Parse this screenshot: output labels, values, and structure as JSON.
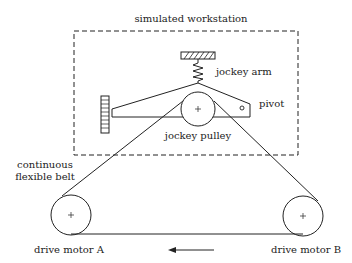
{
  "diagram": {
    "title": "simulated workstation",
    "labels": {
      "jockey_arm": "jockey arm",
      "pivot": "pivot",
      "jockey_pulley": "jockey pulley",
      "belt_line1": "continuous",
      "belt_line2": "flexible belt",
      "motor_a": "drive motor A",
      "motor_b": "drive motor B"
    },
    "direction_arrow": "left",
    "colors": {
      "line": "#222222",
      "background": "#ffffff"
    }
  }
}
